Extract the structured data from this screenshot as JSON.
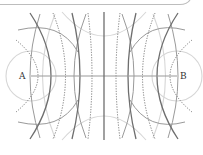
{
  "diagram": {
    "title": "",
    "labels": {
      "left_point": "A",
      "right_point": "B"
    },
    "colors": {
      "axis": "#9a9a9a",
      "dark_line": "#6e6e6e",
      "medium_line": "#9a9a9a",
      "light_line": "#d4d4d4",
      "dotted_line": "#7a7a7a",
      "frame": "#bdbdbd",
      "label": "#333333"
    },
    "axis": {
      "from": "A",
      "to": "B",
      "y": 76,
      "x_start": 31,
      "x_end": 177
    },
    "center_line_x": 104,
    "line_families": [
      {
        "type": "solid-dark",
        "axis_crossings_x": [
          55,
          80,
          104,
          128,
          153
        ]
      },
      {
        "type": "dotted",
        "axis_crossings_x": [
          43,
          68,
          92,
          116,
          140,
          165
        ]
      },
      {
        "type": "solid-medium",
        "axis_crossings_x": [
          33,
          175
        ]
      },
      {
        "type": "solid-light",
        "description": "circles around A and B"
      }
    ]
  }
}
